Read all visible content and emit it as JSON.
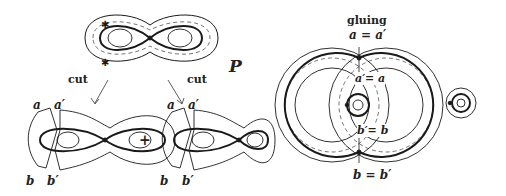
{
  "figure": {
    "source_surface": {
      "label": "P"
    },
    "cut_arrows": {
      "left_label": "cut",
      "right_label": "cut"
    },
    "cut_pieces": {
      "left": {
        "top_labels": [
          "a",
          "a′"
        ],
        "bottom_labels": [
          "b",
          "b′"
        ]
      },
      "operator": "+",
      "right": {
        "top_labels": [
          "a",
          "a′"
        ],
        "bottom_labels": [
          "b",
          "b′"
        ]
      }
    },
    "glued_surface": {
      "title": "gluing",
      "top_equation": "a = a′",
      "inner_top_equation": "a′= a",
      "inner_bottom_equation": "b′= b",
      "bottom_equation": "b = b′"
    }
  },
  "colors": {
    "ink": "#1a1a1a",
    "background": "#ffffff"
  }
}
